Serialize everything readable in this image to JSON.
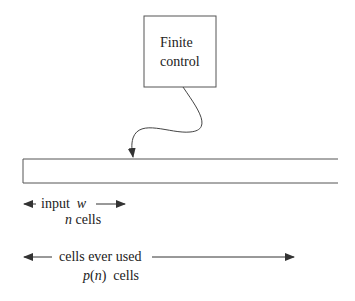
{
  "finite_control": {
    "line1": "Finite",
    "line2": "control"
  },
  "input_label": {
    "text": "input",
    "var": "w"
  },
  "input_size": {
    "var": "n",
    "text": "cells"
  },
  "used_label": {
    "text": "cells ever used"
  },
  "used_size": {
    "func": "p",
    "open": "(",
    "var": "n",
    "close": ")",
    "text": "cells"
  },
  "colors": {
    "stroke": "#555555",
    "text": "#222222"
  }
}
